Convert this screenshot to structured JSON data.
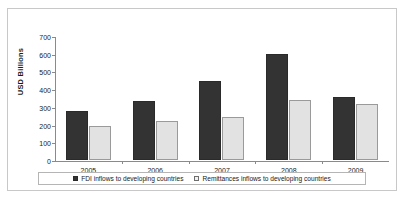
{
  "ghost_text_top": "",
  "axis": {
    "y_title": "USD Billions",
    "y_ticks": [
      0,
      100,
      200,
      300,
      400,
      500,
      600,
      700
    ]
  },
  "legend": {
    "items": [
      {
        "marker": "filled-square-marker",
        "label": "FDI inflows to developing countries"
      },
      {
        "marker": "hollow-square-marker",
        "label": "Remittances inflows to developing countries"
      }
    ]
  },
  "colors": {
    "fdi": "#333333",
    "remittances": "#e2e2e2",
    "axis": "#8a8a8a",
    "frame": "#c8c8c8"
  },
  "chart_data": {
    "type": "bar",
    "title": "",
    "xlabel": "",
    "ylabel": "USD Billions",
    "ylim": [
      0,
      700
    ],
    "ytick_step": 100,
    "grid": false,
    "legend_position": "bottom",
    "categories": [
      "2005",
      "2006",
      "2007",
      "2008",
      "2009"
    ],
    "series": [
      {
        "name": "FDI inflows to developing countries",
        "color": "#333333",
        "values": [
          275,
          335,
          445,
          598,
          358
        ]
      },
      {
        "name": "Remittances inflows to developing countries",
        "color": "#e2e2e2",
        "values": [
          190,
          222,
          243,
          338,
          318
        ]
      }
    ]
  }
}
